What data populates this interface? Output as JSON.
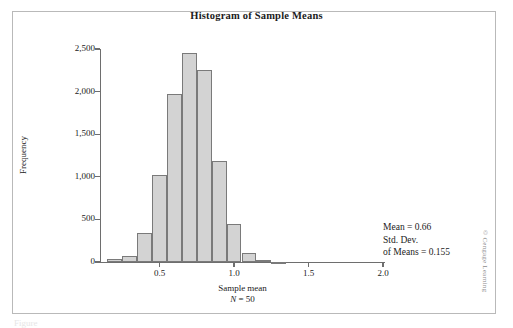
{
  "figure": {
    "credit": "© Cengage Learning",
    "caption_stub": "Figure"
  },
  "annotation": {
    "line1": "Mean = 0.66",
    "line2": "Std. Dev.",
    "line3": "of Means = 0.155"
  },
  "chart_data": {
    "type": "bar",
    "title": "Histogram of Sample Means",
    "xlabel": "Sample mean",
    "xlabel_sub_prefix": "N",
    "xlabel_sub_suffix": " = 50",
    "ylabel": "Frequency",
    "xlim": [
      0.1,
      2.0
    ],
    "ylim": [
      0,
      2500
    ],
    "grid": false,
    "legend": null,
    "bin_width": 0.1,
    "y_ticks": [
      0,
      500,
      1000,
      1500,
      2000,
      2500
    ],
    "y_tick_labels": [
      "0",
      "500",
      "1,000",
      "1,500",
      "2,000",
      "2,500"
    ],
    "x_ticks": [
      0.5,
      1.0,
      1.5,
      2.0
    ],
    "x_tick_labels": [
      "0.5",
      "1.0",
      "1.5",
      "2.0"
    ],
    "bins": [
      {
        "x0": 0.15,
        "x1": 0.25,
        "value": 30
      },
      {
        "x0": 0.25,
        "x1": 0.35,
        "value": 75
      },
      {
        "x0": 0.35,
        "x1": 0.45,
        "value": 340
      },
      {
        "x0": 0.45,
        "x1": 0.55,
        "value": 1020
      },
      {
        "x0": 0.55,
        "x1": 0.65,
        "value": 1970
      },
      {
        "x0": 0.65,
        "x1": 0.75,
        "value": 2450
      },
      {
        "x0": 0.75,
        "x1": 0.85,
        "value": 2250
      },
      {
        "x0": 0.85,
        "x1": 0.95,
        "value": 1180
      },
      {
        "x0": 0.95,
        "x1": 1.05,
        "value": 450
      },
      {
        "x0": 1.05,
        "x1": 1.15,
        "value": 100
      },
      {
        "x0": 1.15,
        "x1": 1.25,
        "value": 20
      },
      {
        "x0": 1.25,
        "x1": 1.35,
        "value": 5
      }
    ],
    "colors": {
      "bar_fill": "#d3d3d3",
      "bar_edge": "#7a7a7a",
      "axis": "#6e6e6e",
      "text": "#1b1b1b",
      "frame": "#b9b9b9"
    }
  }
}
